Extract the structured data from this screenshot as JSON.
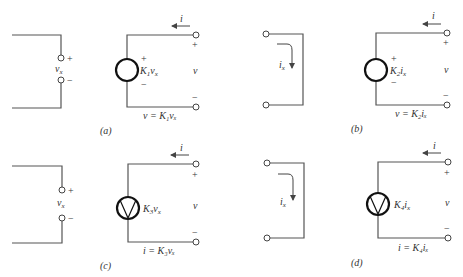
{
  "figure": {
    "panels": [
      {
        "id": "a",
        "caption": "(a)",
        "input": {
          "type": "voltage-port",
          "label": "v",
          "label_sub": "x",
          "plus": "+",
          "minus": "−"
        },
        "source": {
          "type": "dependent-voltage-source",
          "shape": "circle",
          "label": "K",
          "label_sub1": "1",
          "label_var": "v",
          "label_sub2": "x",
          "plus": "+",
          "minus": "−"
        },
        "output": {
          "current_label": "i",
          "voltage_label": "v",
          "plus": "+",
          "minus": "−",
          "equation": "v = K₁vₓ"
        }
      },
      {
        "id": "b",
        "caption": "(b)",
        "input": {
          "type": "current-short",
          "label": "i",
          "label_sub": "x"
        },
        "source": {
          "type": "dependent-voltage-source",
          "shape": "circle",
          "label": "K",
          "label_sub1": "2",
          "label_var": "i",
          "label_sub2": "x",
          "plus": "+",
          "minus": "−"
        },
        "output": {
          "current_label": "i",
          "voltage_label": "v",
          "plus": "+",
          "minus": "−",
          "equation": "v = K₂iₓ"
        }
      },
      {
        "id": "c",
        "caption": "(c)",
        "input": {
          "type": "voltage-port",
          "label": "v",
          "label_sub": "x",
          "plus": "+",
          "minus": "−"
        },
        "source": {
          "type": "dependent-current-source",
          "shape": "circle-with-arrow",
          "label": "K",
          "label_sub1": "3",
          "label_var": "v",
          "label_sub2": "x"
        },
        "output": {
          "current_label": "i",
          "voltage_label": "v",
          "plus": "+",
          "minus": "−",
          "equation": "i = K₃vₓ"
        }
      },
      {
        "id": "d",
        "caption": "(d)",
        "input": {
          "type": "current-short",
          "label": "i",
          "label_sub": "x"
        },
        "source": {
          "type": "dependent-current-source",
          "shape": "circle-with-arrow",
          "label": "K",
          "label_sub1": "4",
          "label_var": "i",
          "label_sub2": "x"
        },
        "output": {
          "current_label": "i",
          "voltage_label": "v",
          "plus": "+",
          "minus": "−",
          "equation": "i = K₄iₓ"
        }
      }
    ]
  }
}
